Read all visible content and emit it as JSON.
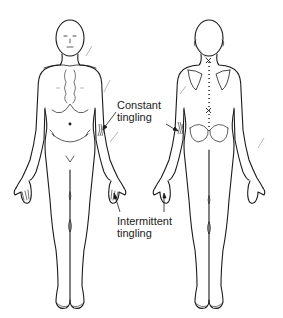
{
  "diagram": {
    "type": "body-chart",
    "views": [
      {
        "name": "front",
        "label": ""
      },
      {
        "name": "back",
        "label": ""
      }
    ],
    "annotations": [
      {
        "id": "constant",
        "line1": "Constant",
        "line2": "tingling",
        "target": "left forearm (front and back view)"
      },
      {
        "id": "intermittent",
        "line1": "Intermittent",
        "line2": "tingling",
        "target": "fingertips of left hand (front and back view)"
      }
    ],
    "colors": {
      "outline": "#1a1a1a",
      "marks": "#9a9a9a",
      "text": "#222222",
      "background": "#ffffff"
    }
  }
}
